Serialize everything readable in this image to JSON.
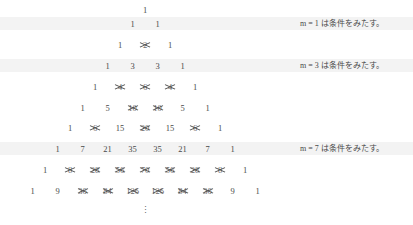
{
  "figure": {
    "kind": "pascals-triangle-with-struck-entries",
    "ellipsis": "⋮",
    "rows": [
      {
        "n": 0,
        "top": 2,
        "highlight": false,
        "cells": [
          {
            "value": "1",
            "struck": false
          }
        ]
      },
      {
        "n": 1,
        "top": 16,
        "highlight": true,
        "band_top": 17,
        "note": "m = 1 は条件をみたす。",
        "note_top": 17,
        "cells": [
          {
            "value": "1",
            "struck": false
          },
          {
            "value": "1",
            "struck": false
          }
        ]
      },
      {
        "n": 2,
        "top": 37,
        "highlight": false,
        "cells": [
          {
            "value": "1",
            "struck": false
          },
          {
            "value": "2",
            "struck": true
          },
          {
            "value": "1",
            "struck": false
          }
        ]
      },
      {
        "n": 3,
        "top": 58,
        "highlight": true,
        "band_top": 59,
        "note": "m = 3 は条件をみたす。",
        "note_top": 59,
        "cells": [
          {
            "value": "1",
            "struck": false
          },
          {
            "value": "3",
            "struck": false
          },
          {
            "value": "3",
            "struck": false
          },
          {
            "value": "1",
            "struck": false
          }
        ]
      },
      {
        "n": 4,
        "top": 79,
        "highlight": false,
        "cells": [
          {
            "value": "1",
            "struck": false
          },
          {
            "value": "4",
            "struck": true
          },
          {
            "value": "6",
            "struck": true
          },
          {
            "value": "4",
            "struck": true
          },
          {
            "value": "1",
            "struck": false
          }
        ]
      },
      {
        "n": 5,
        "top": 100,
        "highlight": false,
        "cells": [
          {
            "value": "1",
            "struck": false
          },
          {
            "value": "5",
            "struck": false
          },
          {
            "value": "10",
            "struck": true
          },
          {
            "value": "10",
            "struck": true
          },
          {
            "value": "5",
            "struck": false
          },
          {
            "value": "1",
            "struck": false
          }
        ]
      },
      {
        "n": 6,
        "top": 120,
        "highlight": false,
        "cells": [
          {
            "value": "1",
            "struck": false
          },
          {
            "value": "6",
            "struck": true
          },
          {
            "value": "15",
            "struck": false
          },
          {
            "value": "20",
            "struck": true
          },
          {
            "value": "15",
            "struck": false
          },
          {
            "value": "6",
            "struck": true
          },
          {
            "value": "1",
            "struck": false
          }
        ]
      },
      {
        "n": 7,
        "top": 141,
        "highlight": true,
        "band_top": 142,
        "note": "m = 7 は条件をみたす。",
        "note_top": 142,
        "cells": [
          {
            "value": "1",
            "struck": false
          },
          {
            "value": "7",
            "struck": false
          },
          {
            "value": "21",
            "struck": false
          },
          {
            "value": "35",
            "struck": false
          },
          {
            "value": "35",
            "struck": false
          },
          {
            "value": "21",
            "struck": false
          },
          {
            "value": "7",
            "struck": false
          },
          {
            "value": "1",
            "struck": false
          }
        ]
      },
      {
        "n": 8,
        "top": 162,
        "highlight": false,
        "cells": [
          {
            "value": "1",
            "struck": false
          },
          {
            "value": "8",
            "struck": true
          },
          {
            "value": "28",
            "struck": true
          },
          {
            "value": "56",
            "struck": true
          },
          {
            "value": "70",
            "struck": true
          },
          {
            "value": "56",
            "struck": true
          },
          {
            "value": "28",
            "struck": true
          },
          {
            "value": "8",
            "struck": true
          },
          {
            "value": "1",
            "struck": false
          }
        ]
      },
      {
        "n": 9,
        "top": 183,
        "highlight": false,
        "cells": [
          {
            "value": "1",
            "struck": false
          },
          {
            "value": "9",
            "struck": false
          },
          {
            "value": "36",
            "struck": true
          },
          {
            "value": "84",
            "struck": true
          },
          {
            "value": "126",
            "struck": true
          },
          {
            "value": "126",
            "struck": true
          },
          {
            "value": "84",
            "struck": true
          },
          {
            "value": "36",
            "struck": true
          },
          {
            "value": "9",
            "struck": false
          },
          {
            "value": "1",
            "struck": false
          }
        ]
      }
    ]
  }
}
